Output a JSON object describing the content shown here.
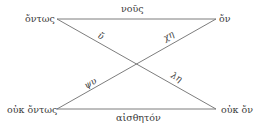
{
  "diagram": {
    "type": "square-of-opposition",
    "nodes": {
      "top_left": "ὄντως",
      "top_right": "ὄν",
      "bottom_left": "οὐκ ὄντως",
      "bottom_right": "οὐκ ὄν"
    },
    "edges": {
      "top": "νοῦς",
      "bottom": "αἰσθητόν",
      "diag_top_left": "ὔ",
      "diag_top_right": "χη",
      "diag_bottom_left": "ψυ",
      "diag_bottom_right": "λη"
    },
    "colors": {
      "line": "#6e6e6e",
      "text": "#3a3a3a",
      "background": "#ffffff"
    }
  }
}
